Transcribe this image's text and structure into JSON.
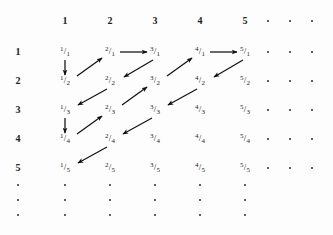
{
  "figure": {
    "background_color": "#fdfdfd",
    "ink_color": "#1a1a1a",
    "arrow_color": "#111111"
  },
  "grid": {
    "column_headers": [
      "1",
      "2",
      "3",
      "4",
      "5"
    ],
    "row_labels": [
      "1",
      "2",
      "3",
      "4",
      "5"
    ],
    "column_x": [
      65,
      110,
      155,
      200,
      245
    ],
    "row_y": [
      52,
      81,
      110,
      139,
      168
    ],
    "header_y": 21,
    "label_x": 18,
    "ellipsis_column_x": [
      268,
      290,
      312
    ],
    "ellipsis_row_y": [
      185,
      200,
      215
    ],
    "ellipsis_dot_columns_x": [
      18,
      65,
      110,
      155,
      200,
      245
    ]
  },
  "cells": [
    {
      "row": 1,
      "col": 1,
      "numerator": "1",
      "denominator": "1",
      "bar": "/"
    },
    {
      "row": 1,
      "col": 2,
      "numerator": "2",
      "denominator": "1",
      "bar": "/"
    },
    {
      "row": 1,
      "col": 3,
      "numerator": "3",
      "denominator": "1",
      "bar": "/"
    },
    {
      "row": 1,
      "col": 4,
      "numerator": "4",
      "denominator": "1",
      "bar": "/"
    },
    {
      "row": 1,
      "col": 5,
      "numerator": "5",
      "denominator": "1",
      "bar": "/"
    },
    {
      "row": 2,
      "col": 1,
      "numerator": "1",
      "denominator": "2",
      "bar": "/"
    },
    {
      "row": 2,
      "col": 2,
      "numerator": "2",
      "denominator": "2",
      "bar": "/"
    },
    {
      "row": 2,
      "col": 3,
      "numerator": "3",
      "denominator": "2",
      "bar": "/"
    },
    {
      "row": 2,
      "col": 4,
      "numerator": "4",
      "denominator": "2",
      "bar": "/"
    },
    {
      "row": 2,
      "col": 5,
      "numerator": "5",
      "denominator": "2",
      "bar": "/"
    },
    {
      "row": 3,
      "col": 1,
      "numerator": "1",
      "denominator": "3",
      "bar": "/"
    },
    {
      "row": 3,
      "col": 2,
      "numerator": "2",
      "denominator": "3",
      "bar": "/"
    },
    {
      "row": 3,
      "col": 3,
      "numerator": "3",
      "denominator": "3",
      "bar": "/"
    },
    {
      "row": 3,
      "col": 4,
      "numerator": "4",
      "denominator": "3",
      "bar": "/"
    },
    {
      "row": 3,
      "col": 5,
      "numerator": "5",
      "denominator": "3",
      "bar": "/"
    },
    {
      "row": 4,
      "col": 1,
      "numerator": "1",
      "denominator": "4",
      "bar": "/"
    },
    {
      "row": 4,
      "col": 2,
      "numerator": "2",
      "denominator": "4",
      "bar": "/"
    },
    {
      "row": 4,
      "col": 3,
      "numerator": "3",
      "denominator": "4",
      "bar": "/"
    },
    {
      "row": 4,
      "col": 4,
      "numerator": "4",
      "denominator": "4",
      "bar": "/"
    },
    {
      "row": 4,
      "col": 5,
      "numerator": "5",
      "denominator": "4",
      "bar": "/"
    },
    {
      "row": 5,
      "col": 1,
      "numerator": "1",
      "denominator": "5",
      "bar": "/"
    },
    {
      "row": 5,
      "col": 2,
      "numerator": "2",
      "denominator": "5",
      "bar": "/"
    },
    {
      "row": 5,
      "col": 3,
      "numerator": "3",
      "denominator": "5",
      "bar": "/"
    },
    {
      "row": 5,
      "col": 4,
      "numerator": "4",
      "denominator": "5",
      "bar": "/"
    },
    {
      "row": 5,
      "col": 5,
      "numerator": "5",
      "denominator": "5",
      "bar": "/"
    }
  ],
  "arrows": [
    {
      "name": "arrow-1-1-to-1-2",
      "from": "1/1",
      "to": "1/2",
      "kind": "vertical-down",
      "x1": 65,
      "y1": 60,
      "x2": 65,
      "y2": 75
    },
    {
      "name": "arrow-1-2-to-2-1",
      "from": "1/2",
      "to": "2/1",
      "kind": "diagonal-up-right",
      "x1": 77,
      "y1": 76,
      "x2": 102,
      "y2": 58
    },
    {
      "name": "arrow-2-1-to-3-1",
      "from": "2/1",
      "to": "3/1",
      "kind": "horizontal-right",
      "x1": 120,
      "y1": 52,
      "x2": 147,
      "y2": 52
    },
    {
      "name": "arrow-3-1-to-2-2",
      "from": "3/1",
      "to": "2/2",
      "kind": "diagonal-down-left",
      "x1": 153,
      "y1": 60,
      "x2": 124,
      "y2": 77
    },
    {
      "name": "arrow-2-2-to-1-3",
      "from": "2/2",
      "to": "1/3",
      "kind": "diagonal-down-left",
      "x1": 107,
      "y1": 89,
      "x2": 78,
      "y2": 105
    },
    {
      "name": "arrow-1-3-to-1-4",
      "from": "1/3",
      "to": "1/4",
      "kind": "vertical-down",
      "x1": 65,
      "y1": 118,
      "x2": 65,
      "y2": 133
    },
    {
      "name": "arrow-1-4-to-2-3",
      "from": "1/4",
      "to": "2/3",
      "kind": "diagonal-up-right",
      "x1": 77,
      "y1": 134,
      "x2": 102,
      "y2": 116
    },
    {
      "name": "arrow-2-3-to-3-2",
      "from": "2/3",
      "to": "3/2",
      "kind": "diagonal-up-right",
      "x1": 122,
      "y1": 105,
      "x2": 147,
      "y2": 87
    },
    {
      "name": "arrow-3-2-to-4-1",
      "from": "3/2",
      "to": "4/1",
      "kind": "diagonal-up-right",
      "x1": 167,
      "y1": 76,
      "x2": 192,
      "y2": 58
    },
    {
      "name": "arrow-4-1-to-5-1",
      "from": "4/1",
      "to": "5/1",
      "kind": "horizontal-right",
      "x1": 210,
      "y1": 52,
      "x2": 237,
      "y2": 52
    },
    {
      "name": "arrow-5-1-to-4-2",
      "from": "5/1",
      "to": "4/2",
      "kind": "diagonal-down-left",
      "x1": 243,
      "y1": 60,
      "x2": 214,
      "y2": 77
    },
    {
      "name": "arrow-4-2-to-3-3",
      "from": "4/2",
      "to": "3/3",
      "kind": "diagonal-down-left",
      "x1": 197,
      "y1": 89,
      "x2": 168,
      "y2": 105
    },
    {
      "name": "arrow-3-3-to-2-4",
      "from": "3/3",
      "to": "2/4",
      "kind": "diagonal-down-left",
      "x1": 152,
      "y1": 118,
      "x2": 123,
      "y2": 134
    },
    {
      "name": "arrow-2-4-to-1-5",
      "from": "2/4",
      "to": "1/5",
      "kind": "diagonal-down-left",
      "x1": 107,
      "y1": 147,
      "x2": 78,
      "y2": 163
    }
  ]
}
